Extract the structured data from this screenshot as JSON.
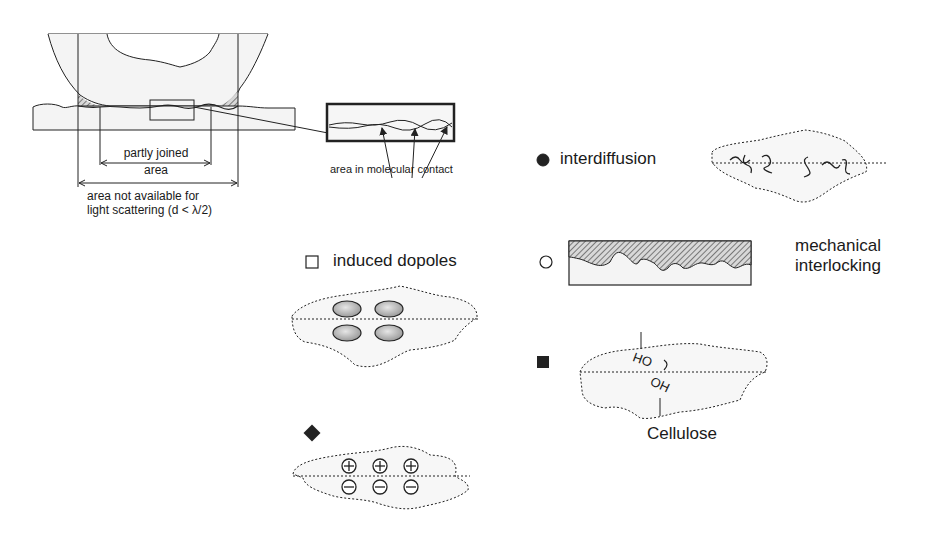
{
  "contact_diagram": {
    "partly_joined_label_1": "partly joined",
    "partly_joined_label_2": "area",
    "not_available_label_1": "area not available for",
    "not_available_label_2": "light scattering (d < λ/2)",
    "molecular_contact_label": "area in molecular contact"
  },
  "mechanisms": [
    {
      "symbol": "filled-circle",
      "label": "interdiffusion"
    },
    {
      "symbol": "open-square",
      "label": "induced dopoles"
    },
    {
      "symbol": "open-circle",
      "label_1": "mechanical",
      "label_2": "interlocking"
    },
    {
      "symbol": "filled-square",
      "label": "Cellulose",
      "groups": [
        "OH",
        "OH"
      ]
    },
    {
      "symbol": "filled-diamond",
      "charges_top": [
        "+",
        "+",
        "+"
      ],
      "charges_bottom": [
        "−",
        "−",
        "−"
      ]
    }
  ],
  "colors": {
    "ink": "#1a1a1a",
    "fill": "#f2f2f2",
    "hatch": "#555555",
    "ellipse": "#b8b8b8"
  }
}
